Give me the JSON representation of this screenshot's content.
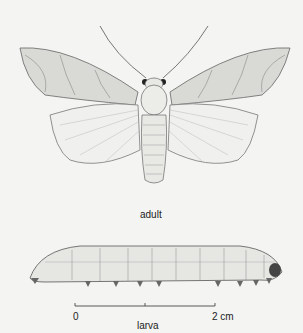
{
  "figure": {
    "adult_label": "adult",
    "larva_label": "larva",
    "scale": {
      "start": "0",
      "end": "2 cm"
    }
  }
}
